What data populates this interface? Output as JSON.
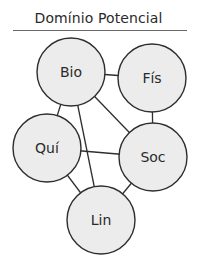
{
  "title": "Domínio Potencial",
  "colors": {
    "node_fill": "#ececec",
    "stroke": "#2e2e2e",
    "text": "#2a2a2a"
  },
  "nodes": [
    {
      "id": "bio",
      "label": "Bio",
      "cx": 71,
      "cy": 72,
      "r": 34
    },
    {
      "id": "fis",
      "label": "Fís",
      "cx": 152,
      "cy": 78,
      "r": 34
    },
    {
      "id": "qui",
      "label": "Quí",
      "cx": 47,
      "cy": 148,
      "r": 34
    },
    {
      "id": "soc",
      "label": "Soc",
      "cx": 153,
      "cy": 157,
      "r": 34
    },
    {
      "id": "lin",
      "label": "Lin",
      "cx": 101,
      "cy": 220,
      "r": 34
    }
  ],
  "edges": [
    [
      "bio",
      "fis"
    ],
    [
      "bio",
      "qui"
    ],
    [
      "bio",
      "lin"
    ],
    [
      "bio",
      "soc"
    ],
    [
      "fis",
      "soc"
    ],
    [
      "qui",
      "soc"
    ],
    [
      "qui",
      "lin"
    ],
    [
      "soc",
      "lin"
    ]
  ]
}
